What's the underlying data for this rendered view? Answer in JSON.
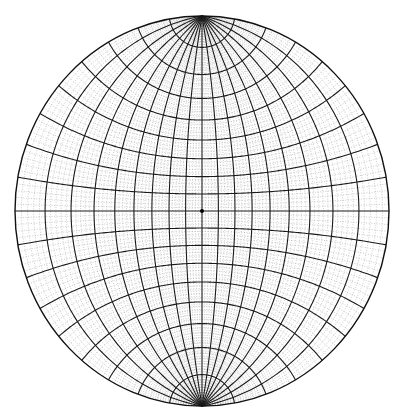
{
  "diagram": {
    "type": "wulff-net",
    "center": [
      202,
      211
    ],
    "radius_x": 187,
    "radius_y": 195,
    "major_interval_deg": 10,
    "minor_interval_deg": 2,
    "colors": {
      "background": "#ffffff",
      "major_line": "#1a1a1a",
      "minor_line": "#8a8a8a",
      "outline": "#111111",
      "center_dot": "#000000"
    },
    "poles": [
      "north",
      "south"
    ]
  }
}
